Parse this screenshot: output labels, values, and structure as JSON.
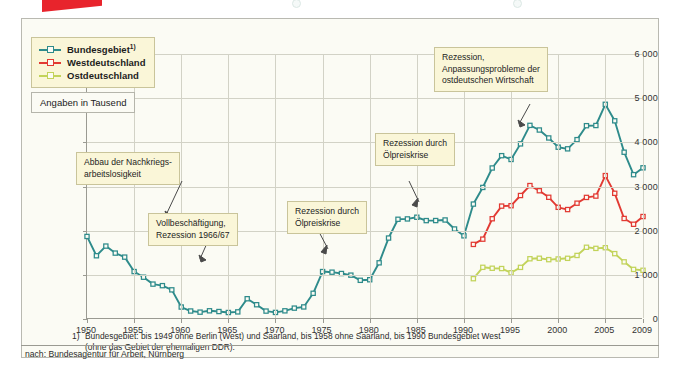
{
  "figure": {
    "units_note": "Angaben in Tausend",
    "source": "nach: Bundesagentur für Arbeit, Nürnberg",
    "footnote_marker": "1)",
    "footnote_line1": "Bundesgebiet: bis 1949 ohne Berlin (West) und Saarland, bis 1958 ohne Saarland, bis 1990 Bundesgebiet West",
    "footnote_line2": "(ohne das Gebiet der ehemaligen DDR)."
  },
  "legend": {
    "items": [
      {
        "label": "Bundesgebiet",
        "sup": "1)",
        "color": "#2e8b8b"
      },
      {
        "label": "Westdeutschland",
        "sup": "",
        "color": "#e23a33"
      },
      {
        "label": "Ostdeutschland",
        "sup": "",
        "color": "#c2d35a"
      }
    ]
  },
  "annotations": [
    {
      "name": "abbau-nachkriegsarbeitslosigkeit",
      "line1": "Abbau der Nachkriegs-",
      "line2": "arbeitslosigkeit",
      "line3": ""
    },
    {
      "name": "vollbeschaeftigung",
      "line1": "Vollbeschäftigung,",
      "line2": "Rezession 1966/67",
      "line3": ""
    },
    {
      "name": "rezession-oelpreiskrise-1",
      "line1": "Rezession durch",
      "line2": "Ölpreiskrise",
      "line3": ""
    },
    {
      "name": "rezession-oelpreiskrise-2",
      "line1": "Rezession durch",
      "line2": "Ölpreiskrise",
      "line3": ""
    },
    {
      "name": "rezession-ostdeutsche-wirtschaft",
      "line1": "Rezession,",
      "line2": "Anpassungsprobleme der",
      "line3": "ostdeutschen Wirtschaft"
    }
  ],
  "chart_data": {
    "type": "line",
    "title": "",
    "xlabel": "",
    "ylabel": "Angaben in Tausend",
    "xlim": [
      1950,
      2009
    ],
    "ylim": [
      0,
      6000
    ],
    "yticks": [
      0,
      1000,
      2000,
      3000,
      4000,
      5000,
      6000
    ],
    "ytick_labels": [
      "0",
      "1000",
      "2000",
      "3000",
      "4000",
      "5000",
      "6000"
    ],
    "xticks": [
      1950,
      1955,
      1960,
      1965,
      1970,
      1975,
      1980,
      1985,
      1990,
      1995,
      2000,
      2005,
      2009
    ],
    "xtick_labels": [
      "1950",
      "1955",
      "1960",
      "1965",
      "1970",
      "1975",
      "1980",
      "1985",
      "1990",
      "1995",
      "2000",
      "2005",
      "2009"
    ],
    "grid": true,
    "legend_position": "top-left",
    "series": [
      {
        "name": "Bundesgebiet",
        "color": "#2e8b8b",
        "x": [
          1950,
          1951,
          1952,
          1953,
          1954,
          1955,
          1956,
          1957,
          1958,
          1959,
          1960,
          1961,
          1962,
          1963,
          1964,
          1965,
          1966,
          1967,
          1968,
          1969,
          1970,
          1971,
          1972,
          1973,
          1974,
          1975,
          1976,
          1977,
          1978,
          1979,
          1980,
          1981,
          1982,
          1983,
          1984,
          1985,
          1986,
          1987,
          1988,
          1989,
          1990,
          1991,
          1992,
          1993,
          1994,
          1995,
          1996,
          1997,
          1998,
          1999,
          2000,
          2001,
          2002,
          2003,
          2004,
          2005,
          2006,
          2007,
          2008,
          2009
        ],
        "values": [
          1869,
          1432,
          1651,
          1492,
          1401,
          1074,
          946,
          790,
          755,
          660,
          271,
          181,
          155,
          186,
          169,
          147,
          161,
          459,
          323,
          179,
          149,
          185,
          246,
          273,
          582,
          1074,
          1060,
          1030,
          993,
          876,
          889,
          1272,
          1833,
          2258,
          2266,
          2304,
          2228,
          2229,
          2242,
          2038,
          1883,
          2602,
          2979,
          3419,
          3698,
          3612,
          3965,
          4384,
          4279,
          4099,
          3890,
          3853,
          4061,
          4377,
          4381,
          4861,
          4487,
          3776,
          3268,
          3423
        ]
      },
      {
        "name": "Westdeutschland",
        "color": "#e23a33",
        "x": [
          1991,
          1992,
          1993,
          1994,
          1995,
          1996,
          1997,
          1998,
          1999,
          2000,
          2001,
          2002,
          2003,
          2004,
          2005,
          2006,
          2007,
          2008,
          2009
        ],
        "values": [
          1689,
          1808,
          2270,
          2556,
          2565,
          2796,
          3021,
          2904,
          2756,
          2529,
          2478,
          2622,
          2753,
          2783,
          3247,
          2846,
          2276,
          2145,
          2320
        ]
      },
      {
        "name": "Ostdeutschland",
        "color": "#c2d35a",
        "x": [
          1991,
          1992,
          1993,
          1994,
          1995,
          1996,
          1997,
          1998,
          1999,
          2000,
          2001,
          2002,
          2003,
          2004,
          2005,
          2006,
          2007,
          2008,
          2009
        ],
        "values": [
          913,
          1170,
          1149,
          1142,
          1047,
          1169,
          1364,
          1375,
          1344,
          1359,
          1374,
          1439,
          1624,
          1599,
          1614,
          1480,
          1294,
          1123,
          1103
        ]
      }
    ]
  }
}
